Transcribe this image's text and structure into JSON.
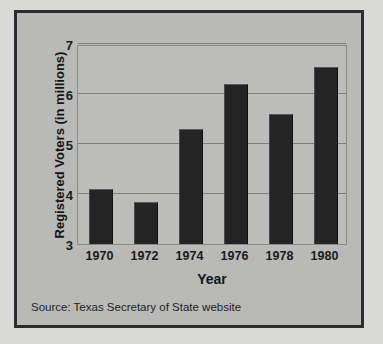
{
  "chart_data": {
    "type": "bar",
    "title": "",
    "xlabel": "Year",
    "ylabel": "Registered Voters (in millions)",
    "categories": [
      "1970",
      "1972",
      "1974",
      "1976",
      "1978",
      "1980"
    ],
    "values": [
      4.1,
      3.85,
      5.3,
      6.2,
      5.6,
      6.55
    ],
    "ylim": [
      3,
      7
    ],
    "yticks": [
      "3",
      "4",
      "5",
      "6",
      "7"
    ],
    "ytick_values": [
      3,
      4,
      5,
      6,
      7
    ],
    "grid": true,
    "legend": "none",
    "source_note": "Source: Texas Secretary of State website",
    "bar_color": "#242424",
    "plot_background": "#bcbcba",
    "figure_background": "#b9b9b7",
    "frame_color": "#2d2d2f",
    "gridline_color": "#7e7e7c"
  }
}
